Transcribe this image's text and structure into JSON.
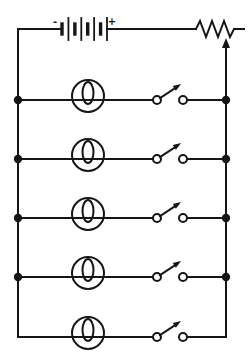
{
  "diagram": {
    "type": "circuit-schematic",
    "background": "#ffffff",
    "line_color": "#161616",
    "stroke_width": 2,
    "canvas": {
      "width": 249,
      "height": 354
    },
    "battery": {
      "minus_label": "-",
      "plus_label": "+",
      "cells": 4,
      "x": 62,
      "x_end": 107,
      "long_plate_half_height": 11,
      "short_plate_half_height": 5
    },
    "top_wire_y": 29,
    "left_bus_x": 18,
    "right_bus_x": 226,
    "bottom_wire_y": 337,
    "rheostat": {
      "x_start": 196,
      "x_end": 234,
      "lead_end_x": 244,
      "wiper_arrow": true
    },
    "branches": [
      {
        "y": 100,
        "junction_dots": true,
        "lamp": true,
        "switch": "open"
      },
      {
        "y": 159,
        "junction_dots": true,
        "lamp": true,
        "switch": "open"
      },
      {
        "y": 218,
        "junction_dots": true,
        "lamp": true,
        "switch": "open"
      },
      {
        "y": 277,
        "junction_dots": true,
        "lamp": true,
        "switch": "open"
      },
      {
        "y": 337,
        "junction_dots": false,
        "lamp": true,
        "switch": "open"
      }
    ],
    "lamp": {
      "cx": 88,
      "r": 16,
      "center_dy": -4,
      "loop_rx": 5.5,
      "loop_ry": 11,
      "loop_dy": -7
    },
    "switch": {
      "left_terminal_x": 157,
      "right_terminal_x": 183,
      "terminal_r": 4
    },
    "junction_dot_r": 4.2
  }
}
